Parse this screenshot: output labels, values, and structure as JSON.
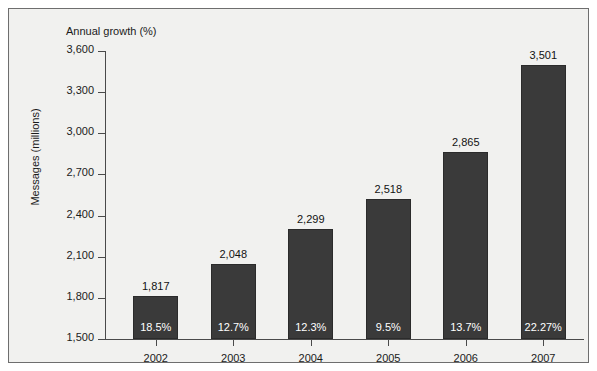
{
  "figure": {
    "top_axis_title": "Annual growth (%)",
    "left_axis_title": "Messages (millions)",
    "frame_color": "#6e6e6e",
    "background_color": "#f1f1ef",
    "bar_color": "#3a3a3a",
    "axis_color": "#4a4a4a"
  },
  "chart_data": {
    "type": "bar",
    "title": "Annual growth (%)",
    "xlabel": "",
    "ylabel": "Messages (millions)",
    "ylim": [
      1500,
      3600
    ],
    "yticks": [
      1500,
      1800,
      2100,
      2400,
      2700,
      3000,
      3300,
      3600
    ],
    "ytick_labels": [
      "1,500",
      "1,800",
      "2,100",
      "2,400",
      "2,700",
      "3,000",
      "3,300",
      "3,600"
    ],
    "grid": false,
    "legend": null,
    "categories": [
      "2002",
      "2003",
      "2004",
      "2005",
      "2006",
      "2007"
    ],
    "values": [
      1817,
      2048,
      2299,
      2518,
      2865,
      3501
    ],
    "value_labels": [
      "1,817",
      "2,048",
      "2,299",
      "2,518",
      "2,865",
      "3,501"
    ],
    "annotations": {
      "name": "Annual growth (%)",
      "labels": [
        "18.5%",
        "12.7%",
        "12.3%",
        "9.5%",
        "13.7%",
        "22.27%"
      ],
      "values": [
        18.5,
        12.7,
        12.3,
        9.5,
        13.7,
        22.27
      ]
    }
  }
}
